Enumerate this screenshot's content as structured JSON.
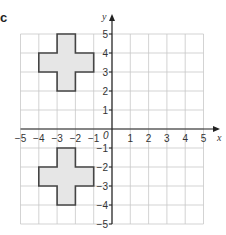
{
  "part_label": "c",
  "axes": {
    "x_label": "x",
    "y_label": "y",
    "origin_label": "0",
    "x_ticks": [
      -5,
      -4,
      -3,
      -2,
      -1,
      1,
      2,
      3,
      4,
      5
    ],
    "y_ticks": [
      5,
      4,
      3,
      2,
      1,
      -1,
      -2,
      -3,
      -4,
      -5
    ],
    "range": {
      "x": [
        -5,
        5
      ],
      "y": [
        -5,
        5
      ]
    }
  },
  "shapes": [
    {
      "name": "cross-upper",
      "fill": "#e6e6e6",
      "stroke": "#444444",
      "vertices": [
        [
          -3,
          5
        ],
        [
          -2,
          5
        ],
        [
          -2,
          4
        ],
        [
          -1,
          4
        ],
        [
          -1,
          3
        ],
        [
          -2,
          3
        ],
        [
          -2,
          2
        ],
        [
          -3,
          2
        ],
        [
          -3,
          3
        ],
        [
          -4,
          3
        ],
        [
          -4,
          4
        ],
        [
          -3,
          4
        ]
      ]
    },
    {
      "name": "cross-lower",
      "fill": "#e6e6e6",
      "stroke": "#444444",
      "vertices": [
        [
          -3,
          -1
        ],
        [
          -2,
          -1
        ],
        [
          -2,
          -2
        ],
        [
          -1,
          -2
        ],
        [
          -1,
          -3
        ],
        [
          -2,
          -3
        ],
        [
          -2,
          -4
        ],
        [
          -3,
          -4
        ],
        [
          -3,
          -3
        ],
        [
          -4,
          -3
        ],
        [
          -4,
          -2
        ],
        [
          -3,
          -2
        ]
      ]
    }
  ],
  "colors": {
    "grid": "#c8c8c8",
    "axis": "#222222",
    "text": "#333333"
  }
}
